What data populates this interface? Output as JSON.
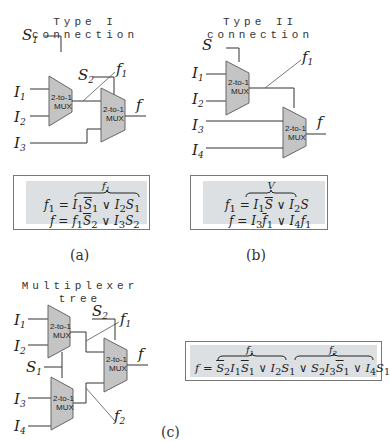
{
  "panels": {
    "a": {
      "title_line1": "Type I",
      "title_line2": "connection",
      "caption": "(a)",
      "signals": {
        "s1": "S",
        "s1_sub": "1",
        "s2": "S",
        "s2_sub": "2",
        "i1": "I",
        "i1_sub": "1",
        "i2": "I",
        "i2_sub": "2",
        "i3": "I",
        "i3_sub": "3",
        "f1": "f",
        "f1_sub": "1",
        "f": "f"
      },
      "mux_label_line1": "2-to-1",
      "mux_label_line2": "MUX",
      "brace_label": "f1",
      "eq1_lhs": "f1 =",
      "eq1_rhs": "I1 S̄1 ∨ I2 S1",
      "eq2_lhs": "f =",
      "eq2_rhs": "f1 S̄2 ∨ I3 S2"
    },
    "b": {
      "title_line1": "Type II",
      "title_line2": "connection",
      "caption": "(b)",
      "signals": {
        "s": "S",
        "i1": "I",
        "i1_sub": "1",
        "i2": "I",
        "i2_sub": "2",
        "i3": "I",
        "i3_sub": "3",
        "i4": "I",
        "i4_sub": "4",
        "f1": "f",
        "f1_sub": "1",
        "f": "f"
      },
      "mux_label_line1": "2-to-1",
      "mux_label_line2": "MUX",
      "brace_label": "V",
      "eq1_lhs": "f1 =",
      "eq1_rhs": "I1 S̄ ∨ I2 S",
      "eq2_lhs": "f =",
      "eq2_rhs": "I3 f̄1 ∨ I4 f1"
    },
    "c": {
      "title_line1": "Multiplexer",
      "title_line2": "tree",
      "caption": "(c)",
      "signals": {
        "s1": "S",
        "s1_sub": "1",
        "s2": "S",
        "s2_sub": "2",
        "i1": "I",
        "i1_sub": "1",
        "i2": "I",
        "i2_sub": "2",
        "i3": "I",
        "i3_sub": "3",
        "i4": "I",
        "i4_sub": "4",
        "f1": "f",
        "f1_sub": "1",
        "f2": "f",
        "f2_sub": "2",
        "f": "f"
      },
      "mux_label_line1": "2-to-1",
      "mux_label_line2": "MUX",
      "brace_label_1": "f1",
      "brace_label_2": "f2",
      "eq_lhs": "f =",
      "eq_rhs": "S̄2 I1 S̄1 ∨ I2 S1 ∨ S2 I3 S̄1 ∨ I4 S1"
    }
  }
}
